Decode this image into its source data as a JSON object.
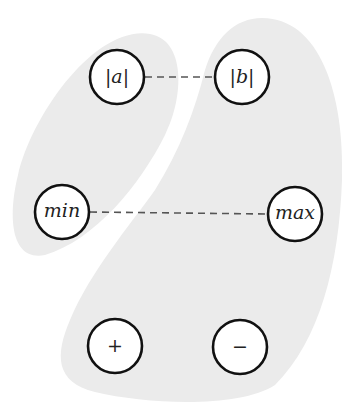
{
  "diagram": {
    "background_color": "#ffffff",
    "region_color": "#ebebeb",
    "regions": [
      {
        "id": "left-region",
        "members": [
          "abs_a",
          "min"
        ]
      },
      {
        "id": "right-region",
        "members": [
          "abs_b",
          "max",
          "plus",
          "minus"
        ]
      }
    ],
    "nodes": {
      "abs_a": {
        "label": "|a|",
        "cx": 117,
        "cy": 77
      },
      "abs_b": {
        "label": "|b|",
        "cx": 242,
        "cy": 77
      },
      "min": {
        "label": "min",
        "cx": 62,
        "cy": 212
      },
      "max": {
        "label": "max",
        "cx": 295,
        "cy": 214
      },
      "plus": {
        "label": "+",
        "cx": 115,
        "cy": 346
      },
      "minus": {
        "label": "−",
        "cx": 240,
        "cy": 347
      }
    },
    "edges": [
      {
        "from": "abs_a",
        "to": "abs_b",
        "style": "dashed"
      },
      {
        "from": "min",
        "to": "max",
        "style": "dashed"
      }
    ]
  }
}
